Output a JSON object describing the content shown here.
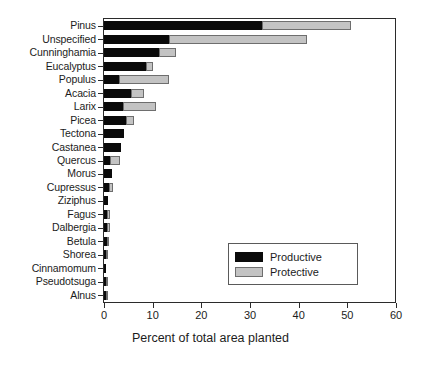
{
  "chart_data": {
    "type": "bar",
    "orientation": "horizontal",
    "stacked": true,
    "title": "",
    "xlabel": "Percent of total area planted",
    "ylabel": "",
    "xlim": [
      0,
      60
    ],
    "xticks": [
      0,
      10,
      20,
      30,
      40,
      50,
      60
    ],
    "xticklabels": [
      "0",
      "10",
      "20",
      "30",
      "40",
      "50",
      "60"
    ],
    "grid": false,
    "legend_position": "lower-right-inside",
    "categories": [
      "Pinus",
      "Unspecified",
      "Cunninghamia",
      "Eucalyptus",
      "Populus",
      "Acacia",
      "Larix",
      "Picea",
      "Tectona",
      "Castanea",
      "Quercus",
      "Morus",
      "Cupressus",
      "Ziziphus",
      "Fagus",
      "Dalbergia",
      "Betula",
      "Shorea",
      "Cinnamomum",
      "Pseudotsuga",
      "Alnus"
    ],
    "series": [
      {
        "name": "Productive",
        "color": "#0a0a0a",
        "values": [
          32.4,
          13.3,
          11.3,
          8.6,
          3.0,
          5.5,
          3.9,
          4.5,
          4.1,
          3.5,
          1.2,
          1.6,
          1.0,
          0.8,
          0.7,
          0.6,
          0.6,
          0.5,
          0.5,
          0.4,
          0.4
        ]
      },
      {
        "name": "Protective",
        "color": "#c3c3c3",
        "values": [
          18.4,
          28.5,
          3.5,
          1.4,
          10.3,
          2.7,
          6.7,
          1.6,
          0.0,
          0.0,
          2.1,
          0.0,
          0.9,
          0.0,
          0.6,
          0.7,
          0.2,
          0.4,
          0.0,
          0.3,
          0.4
        ]
      }
    ],
    "totals": [
      50.8,
      41.8,
      14.8,
      10.0,
      13.3,
      8.2,
      10.6,
      6.1,
      4.1,
      3.5,
      3.3,
      1.6,
      1.9,
      0.8,
      1.3,
      1.3,
      0.8,
      0.9,
      0.5,
      0.7,
      0.8
    ]
  },
  "legend": {
    "entries": [
      {
        "label": "Productive"
      },
      {
        "label": "Protective"
      }
    ]
  }
}
